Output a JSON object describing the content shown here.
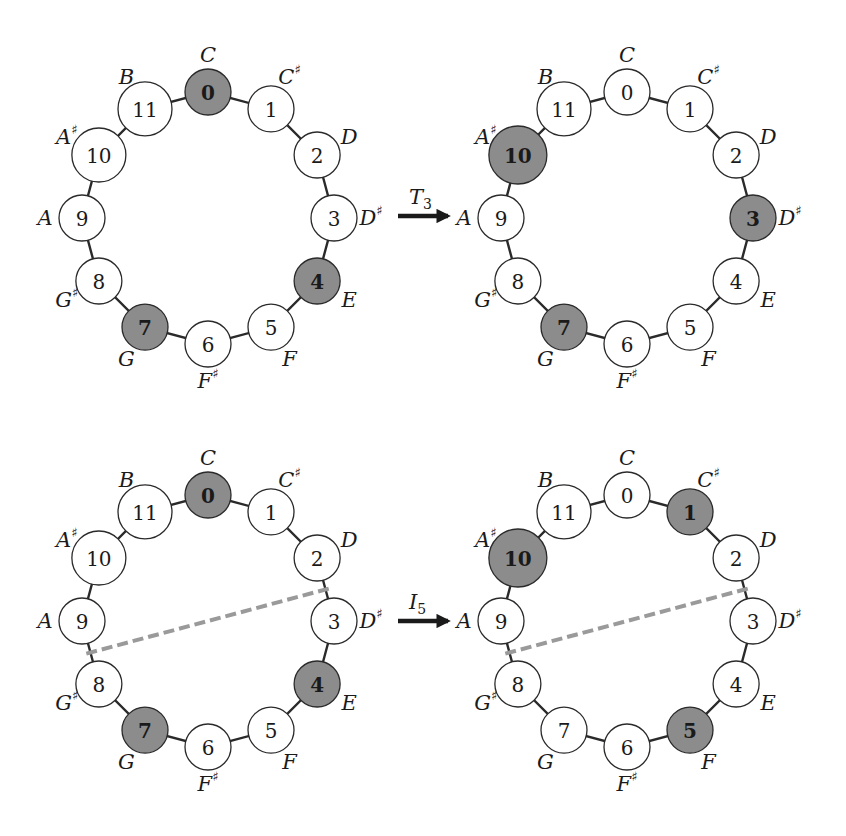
{
  "figure": {
    "colors": {
      "highlight_fill": "#8c8c8c",
      "normal_fill": "#ffffff",
      "stroke": "#2a2a2a",
      "axis": "#9a9a9a"
    },
    "pitch_classes": [
      {
        "num": "0",
        "note": "C",
        "sharp": ""
      },
      {
        "num": "1",
        "note": "C",
        "sharp": "♯"
      },
      {
        "num": "2",
        "note": "D",
        "sharp": ""
      },
      {
        "num": "3",
        "note": "D",
        "sharp": "♯"
      },
      {
        "num": "4",
        "note": "E",
        "sharp": ""
      },
      {
        "num": "5",
        "note": "F",
        "sharp": ""
      },
      {
        "num": "6",
        "note": "F",
        "sharp": "♯"
      },
      {
        "num": "7",
        "note": "G",
        "sharp": ""
      },
      {
        "num": "8",
        "note": "G",
        "sharp": "♯"
      },
      {
        "num": "9",
        "note": "A",
        "sharp": ""
      },
      {
        "num": "10",
        "note": "A",
        "sharp": "♯"
      },
      {
        "num": "11",
        "note": "B",
        "sharp": ""
      }
    ],
    "panels": [
      {
        "id": "top-left",
        "cx": 208,
        "cy": 218,
        "highlighted": [
          0,
          4,
          7
        ],
        "axis": null
      },
      {
        "id": "top-right",
        "cx": 627,
        "cy": 218,
        "highlighted": [
          3,
          7,
          10
        ],
        "axis": null
      },
      {
        "id": "bottom-left",
        "cx": 208,
        "cy": 621,
        "highlighted": [
          0,
          4,
          7
        ],
        "axis": [
          2.5,
          8.5
        ]
      },
      {
        "id": "bottom-right",
        "cx": 627,
        "cy": 621,
        "highlighted": [
          1,
          5,
          10
        ],
        "axis": [
          2.5,
          8.5
        ]
      }
    ],
    "operations": [
      {
        "id": "transpose",
        "label": "T",
        "subscript": "3",
        "y": 216
      },
      {
        "id": "invert",
        "label": "I",
        "subscript": "5",
        "y": 621
      }
    ]
  }
}
